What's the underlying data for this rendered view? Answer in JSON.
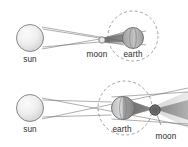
{
  "figure": {
    "background_color": "#ffffff",
    "width": 188,
    "height": 147,
    "panels": [
      {
        "id": "solar-eclipse",
        "caption": "solar eclipse configuration: moon between sun and earth",
        "labels": {
          "sun": "sun",
          "moon": "moon",
          "earth": "earth"
        },
        "bodies": [
          {
            "name": "sun",
            "cx": 30,
            "cy": 38,
            "r": 13.5,
            "fill": "#ededed",
            "stroke": "#7d7d7d"
          },
          {
            "name": "moon",
            "cx": 102,
            "cy": 40,
            "r": 3.2,
            "fill": "#e4e4e4",
            "stroke": "#6e6e6e"
          },
          {
            "name": "earth",
            "cx": 133,
            "cy": 38,
            "r": 10.5,
            "fill": "#cfcfcf",
            "stroke": "#6b6b6b"
          }
        ],
        "orbit": {
          "name": "moon-orbit-around-earth",
          "cx": 133,
          "cy": 36,
          "r": 25,
          "stroke": "#8f8f8f",
          "dash": "3 2.4"
        },
        "shadow": {
          "name": "moon-umbra-cone",
          "color": "#8a8a8a"
        }
      },
      {
        "id": "lunar-eclipse",
        "caption": "lunar eclipse configuration: earth between sun and moon",
        "labels": {
          "sun": "sun",
          "earth": "earth",
          "moon": "moon"
        },
        "bodies": [
          {
            "name": "sun",
            "cx": 30,
            "cy": 34,
            "r": 13.5,
            "fill": "#ededed",
            "stroke": "#7d7d7d"
          },
          {
            "name": "earth",
            "cx": 123,
            "cy": 34,
            "r": 11.5,
            "fill": "#cdcdcd",
            "stroke": "#6b6b6b"
          },
          {
            "name": "moon",
            "cx": 155,
            "cy": 36,
            "r": 5.2,
            "fill": "#6f6f6f",
            "stroke": "#3d3d3d"
          }
        ],
        "orbit": {
          "name": "moon-orbit-around-earth",
          "cx": 125,
          "cy": 34,
          "r": 27,
          "stroke": "#8f8f8f",
          "dash": "3 2.4"
        },
        "shadow": {
          "name": "earth-shadow-umbra-penumbra",
          "umbra_color": "#6d6d6d",
          "penumbra_color": "#a9a9a9"
        }
      }
    ]
  }
}
